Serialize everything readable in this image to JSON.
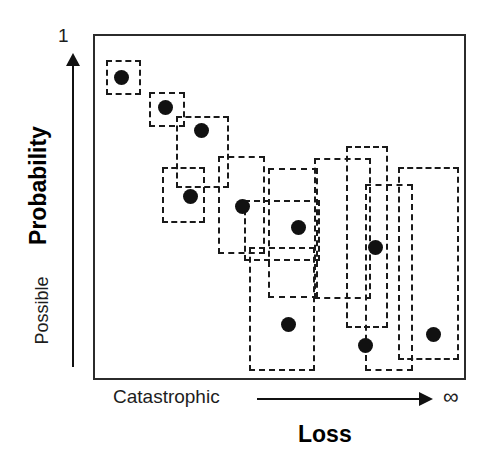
{
  "chart_data": {
    "type": "scatter",
    "title": "",
    "xlabel": "Loss",
    "ylabel": "Probability",
    "x_axis": {
      "title": "Loss",
      "low_label": "Catastrophic",
      "high_label": "∞",
      "direction": "increasing-right",
      "arrow": true
    },
    "y_axis": {
      "title": "Probability",
      "top_label": "1",
      "bottom_label": "Possible",
      "direction": "increasing-up",
      "arrow": true
    },
    "grid": false,
    "legend": null,
    "points": [
      {
        "id": 1,
        "x": 0.07,
        "y": 0.88,
        "px": 119,
        "py": 75,
        "r": 7.5
      },
      {
        "id": 2,
        "x": 0.19,
        "y": 0.79,
        "px": 163,
        "py": 105,
        "r": 7.5
      },
      {
        "id": 3,
        "x": 0.29,
        "y": 0.73,
        "px": 199,
        "py": 128,
        "r": 7.5
      },
      {
        "id": 4,
        "x": 0.26,
        "y": 0.54,
        "px": 188,
        "py": 194,
        "r": 7.5
      },
      {
        "id": 5,
        "x": 0.4,
        "y": 0.51,
        "px": 240,
        "py": 204,
        "r": 7.5
      },
      {
        "id": 6,
        "x": 0.55,
        "y": 0.45,
        "px": 296,
        "py": 225,
        "r": 7.5
      },
      {
        "id": 7,
        "x": 0.75,
        "y": 0.39,
        "px": 373,
        "py": 245,
        "r": 7.5
      },
      {
        "id": 8,
        "x": 0.52,
        "y": 0.17,
        "px": 286,
        "py": 322,
        "r": 7.5
      },
      {
        "id": 9,
        "x": 0.72,
        "y": 0.11,
        "px": 363,
        "py": 343,
        "r": 7.5
      },
      {
        "id": 10,
        "x": 0.9,
        "y": 0.14,
        "px": 431,
        "py": 332,
        "r": 7.5
      }
    ],
    "uncertainty_boxes": [
      {
        "id": 1,
        "left": 104,
        "top": 58,
        "width": 35,
        "height": 35
      },
      {
        "id": 2,
        "left": 147,
        "top": 90,
        "width": 36,
        "height": 35
      },
      {
        "id": 3,
        "left": 174,
        "top": 114,
        "width": 53,
        "height": 72
      },
      {
        "id": 4,
        "left": 160,
        "top": 165,
        "width": 43,
        "height": 56
      },
      {
        "id": 5,
        "left": 216,
        "top": 154,
        "width": 47,
        "height": 98
      },
      {
        "id": 6,
        "left": 266,
        "top": 166,
        "width": 50,
        "height": 130
      },
      {
        "id": 7,
        "left": 344,
        "top": 144,
        "width": 42,
        "height": 182
      },
      {
        "id": 8,
        "left": 247,
        "top": 245,
        "width": 66,
        "height": 124
      },
      {
        "id": 9,
        "left": 363,
        "top": 182,
        "width": 48,
        "height": 187
      },
      {
        "id": 10,
        "left": 396,
        "top": 165,
        "width": 61,
        "height": 193
      },
      {
        "id": 11,
        "left": 242,
        "top": 198,
        "width": 76,
        "height": 61
      },
      {
        "id": 12,
        "left": 312,
        "top": 156,
        "width": 57,
        "height": 141
      }
    ]
  },
  "figure": {
    "background": "#ffffff",
    "frame_color": "#2b2b2b",
    "dot_color": "#111111",
    "box_stroke_color": "#1a1a1a",
    "axis_text_color": "#1d1d1d"
  }
}
